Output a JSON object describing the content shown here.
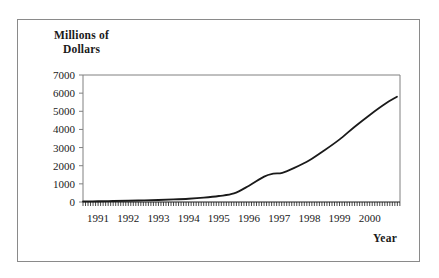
{
  "figure": {
    "background_color": "#ffffff",
    "border_color": "#8a8a8a",
    "axis_color": "#808080",
    "series_color": "#1a1a1a"
  },
  "labels": {
    "y_axis_title_line1": "Millions of",
    "y_axis_title_line2": "Dollars",
    "x_axis_title": "Year"
  },
  "chart_data": {
    "type": "line",
    "title": "",
    "xlabel": "Year",
    "ylabel": "Millions of Dollars",
    "ylim": [
      0,
      7000
    ],
    "xlim": [
      1991,
      2001.5
    ],
    "grid": false,
    "legend": null,
    "y_ticks": [
      0,
      1000,
      2000,
      3000,
      4000,
      5000,
      6000,
      7000
    ],
    "y_tick_labels": [
      "0",
      "1000",
      "2000",
      "3000",
      "4000",
      "5000",
      "6000",
      "7000"
    ],
    "x_ticks": [
      1991,
      1992,
      1993,
      1994,
      1995,
      1996,
      1997,
      1998,
      1999,
      2000
    ],
    "x_tick_labels": [
      "1991",
      "1992",
      "1993",
      "1994",
      "1995",
      "1996",
      "1997",
      "1998",
      "1999",
      "2000"
    ],
    "x_minor_tick_interval": 0.0833,
    "series": [
      {
        "name": "Millions of Dollars",
        "x": [
          1991.0,
          1991.5,
          1992.0,
          1992.5,
          1993.0,
          1993.5,
          1994.0,
          1994.5,
          1995.0,
          1995.5,
          1996.0,
          1996.5,
          1997.0,
          1997.3,
          1997.6,
          1998.0,
          1998.5,
          1999.0,
          1999.5,
          2000.0,
          2000.5,
          2001.0,
          2001.4
        ],
        "values": [
          30,
          40,
          55,
          70,
          90,
          110,
          140,
          180,
          240,
          330,
          470,
          900,
          1400,
          1560,
          1610,
          1880,
          2300,
          2850,
          3450,
          4150,
          4800,
          5400,
          5800
        ]
      }
    ]
  }
}
